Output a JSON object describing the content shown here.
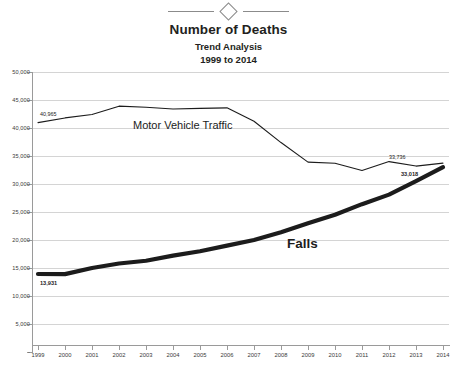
{
  "ornament": {
    "shape": "diamond-divider"
  },
  "chart_data": {
    "type": "line",
    "title": "Number of Deaths",
    "subtitle": "Trend Analysis",
    "subtitle2": "1999 to 2014",
    "xlabel": "",
    "ylabel": "",
    "ylim": [
      0,
      50000
    ],
    "grid": true,
    "legend": "inline-labels",
    "categories": [
      "1999",
      "2000",
      "2001",
      "2002",
      "2003",
      "2004",
      "2005",
      "2006",
      "2007",
      "2008",
      "2009",
      "2010",
      "2011",
      "2012",
      "2013",
      "2014"
    ],
    "ytick_labels": [
      "50,000",
      "45,000",
      "40,000",
      "35,000",
      "30,000",
      "25,000",
      "20,000",
      "15,000",
      "10,000",
      "5,000",
      "-"
    ],
    "ytick_values": [
      50000,
      45000,
      40000,
      35000,
      30000,
      25000,
      20000,
      15000,
      10000,
      5000,
      0
    ],
    "series": [
      {
        "name": "Motor Vehicle Traffic",
        "style": "thin",
        "values": [
          40965,
          41800,
          42400,
          43900,
          43700,
          43400,
          43500,
          43600,
          41200,
          37400,
          33900,
          33700,
          32400,
          34000,
          33200,
          33736
        ],
        "start_label": "40,965",
        "end_label": "33,736"
      },
      {
        "name": "Falls",
        "style": "thick",
        "values": [
          13931,
          13900,
          15000,
          15800,
          16300,
          17200,
          18000,
          19000,
          20000,
          21400,
          23000,
          24500,
          26400,
          28100,
          30500,
          33018
        ],
        "start_label": "13,931",
        "end_label": "33,018"
      }
    ]
  },
  "footnote": ""
}
